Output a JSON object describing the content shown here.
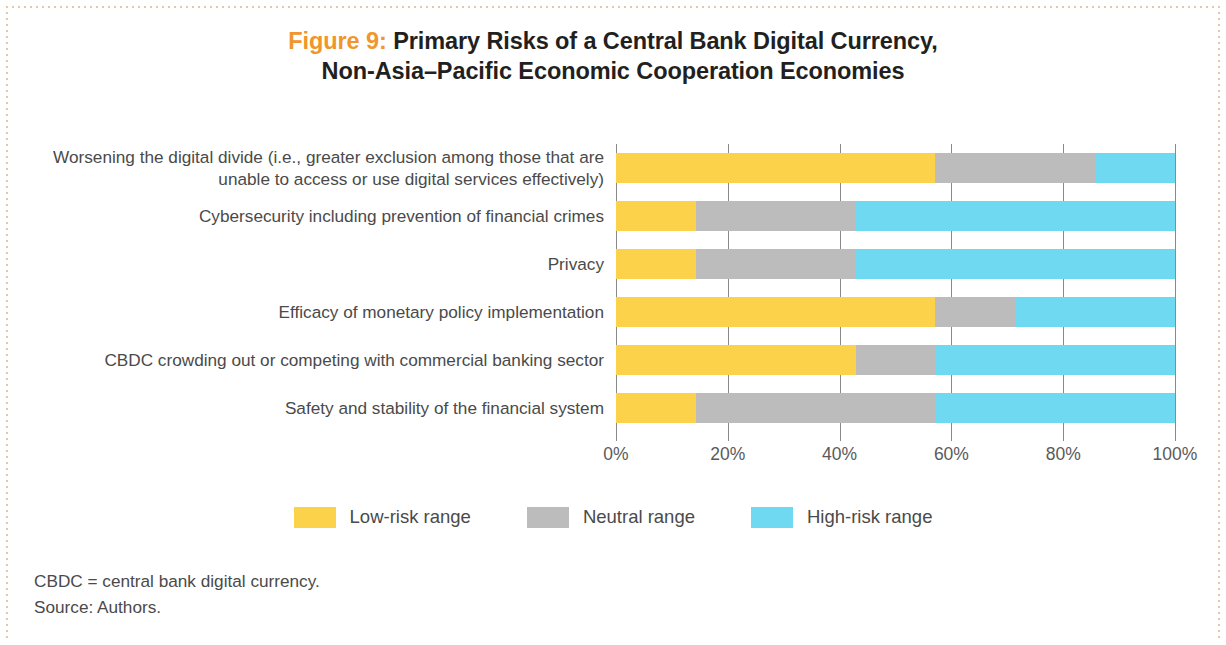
{
  "title": {
    "figure_label": "Figure 9:",
    "line1_rest": " Primary Risks of a Central Bank Digital Currency,",
    "line2": "Non-Asia–Pacific Economic Cooperation Economies",
    "label_color": "#f0962c"
  },
  "notes": {
    "abbreviation": "CBDC = central bank digital currency.",
    "source": "Source: Authors."
  },
  "legend": {
    "items": [
      {
        "label": "Low-risk range",
        "color": "#fbd24a"
      },
      {
        "label": "Neutral range",
        "color": "#bcbcbc"
      },
      {
        "label": "High-risk range",
        "color": "#6fd9f2"
      }
    ]
  },
  "chart_data": {
    "type": "bar",
    "orientation": "horizontal",
    "stacked": true,
    "normalized_percent": true,
    "title": "Figure 9: Primary Risks of a Central Bank Digital Currency, Non-Asia–Pacific Economic Cooperation Economies",
    "xlabel": "",
    "ylabel": "",
    "xlim": [
      0,
      100
    ],
    "xticks": [
      0,
      20,
      40,
      60,
      80,
      100
    ],
    "xtick_labels": [
      "0%",
      "20%",
      "40%",
      "60%",
      "80%",
      "100%"
    ],
    "grid": true,
    "legend_position": "bottom",
    "categories": [
      "Worsening the digital divide (i.e., greater exclusion among those that are unable to access or use digital services effectively)",
      "Cybersecurity including prevention of financial crimes",
      "Privacy",
      "Efficacy of monetary policy implementation",
      "CBDC crowding out or competing with commercial banking sector",
      "Safety and stability of the financial system"
    ],
    "series": [
      {
        "name": "Low-risk range",
        "color": "#fbd24a",
        "values": [
          57.1,
          14.3,
          14.3,
          57.1,
          42.9,
          14.3
        ]
      },
      {
        "name": "Neutral range",
        "color": "#bcbcbc",
        "values": [
          28.6,
          28.6,
          28.6,
          14.3,
          14.3,
          42.9
        ]
      },
      {
        "name": "High-risk range",
        "color": "#6fd9f2",
        "values": [
          14.3,
          57.1,
          57.1,
          28.6,
          42.9,
          42.9
        ]
      }
    ]
  }
}
